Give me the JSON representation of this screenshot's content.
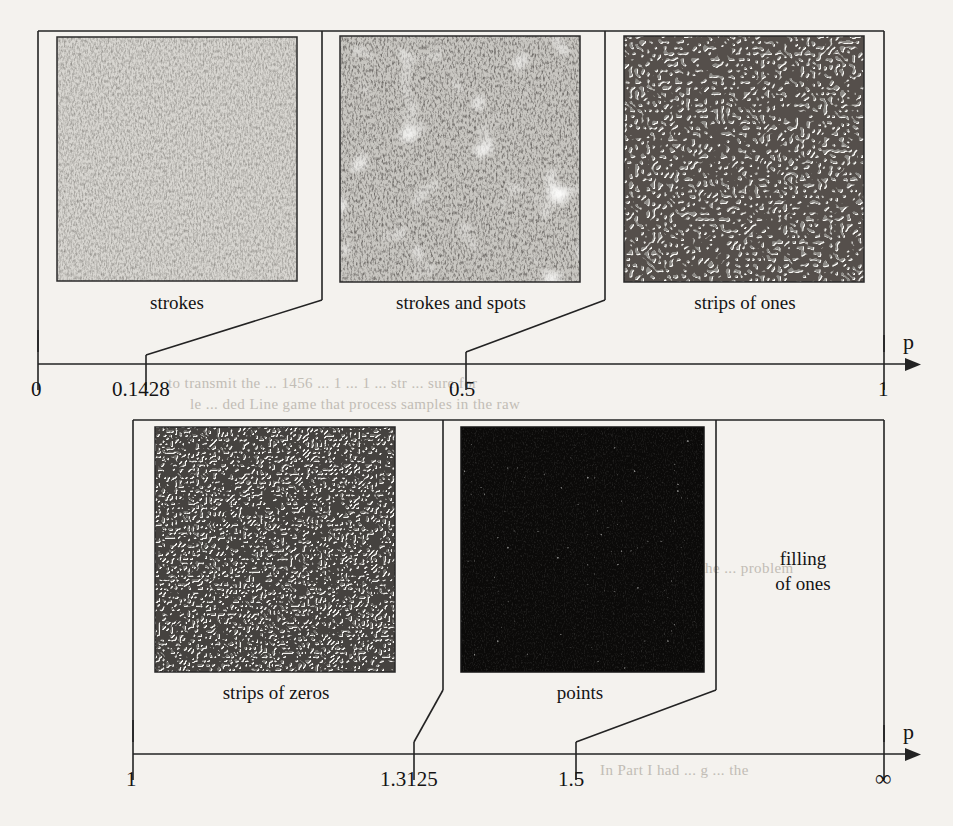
{
  "figure": {
    "kind": "parameter-line-diagram",
    "axis_name": "p",
    "background_color": "#f4f2ee",
    "ink_color": "#1a1a1a"
  },
  "axes": [
    {
      "id": "top-axis",
      "name": "p",
      "start_label": "0",
      "end_label": "1",
      "ticks": [
        {
          "value": "0",
          "pos": 0.0
        },
        {
          "value": "0.1428",
          "pos": 0.1428
        },
        {
          "value": "0.5",
          "pos": 0.5
        },
        {
          "value": "1",
          "pos": 1.0
        }
      ],
      "regions": [
        {
          "label": "strokes",
          "from": "0",
          "to": "0.1428"
        },
        {
          "label": "strokes and spots",
          "from": "0.1428",
          "to": "0.5"
        },
        {
          "label": "strips of ones",
          "from": "0.5",
          "to": "1"
        }
      ]
    },
    {
      "id": "bottom-axis",
      "name": "p",
      "start_label": "1",
      "end_label": "∞",
      "ticks": [
        {
          "value": "1",
          "pos": 0.0
        },
        {
          "value": "1.3125",
          "pos": 0.3125
        },
        {
          "value": "1.5",
          "pos": 0.5
        },
        {
          "value": "∞",
          "pos": 1.0
        }
      ],
      "regions": [
        {
          "label": "strips of zeros",
          "from": "1",
          "to": "1.3125"
        },
        {
          "label": "points",
          "from": "1.3125",
          "to": "1.5"
        },
        {
          "label": "filling of ones",
          "from": "1.5",
          "to": "∞"
        }
      ]
    }
  ],
  "panels": [
    {
      "id": "panel-strokes",
      "caption": "strokes",
      "texture": "fine-light-strokes",
      "base_color": "#cfcdc8",
      "ink_color": "#4a4845",
      "density": 0.34
    },
    {
      "id": "panel-strokes-and-spots",
      "caption": "strokes and spots",
      "texture": "strokes-with-white-spots",
      "base_color": "#b7b5b0",
      "ink_color": "#2e2c2a",
      "density": 0.55
    },
    {
      "id": "panel-strips-of-ones",
      "caption": "strips of ones",
      "texture": "labyrinth-mid-gray",
      "base_color": "#8d8b87",
      "ink_color": "#24221f",
      "density": 0.62
    },
    {
      "id": "panel-strips-of-zeros",
      "caption": "strips of zeros",
      "texture": "labyrinth-dense-dark",
      "base_color": "#6e6c68",
      "ink_color": "#171513",
      "density": 0.74
    },
    {
      "id": "panel-points",
      "caption": "points",
      "texture": "black-with-white-points",
      "base_color": "#0c0b0a",
      "ink_color": "#e8e6e0",
      "density": 0.06
    },
    {
      "id": "panel-filling-of-ones",
      "caption": "filling\nof ones",
      "caption_line1": "filling",
      "caption_line2": "of ones",
      "texture": "none",
      "base_color": "#f4f2ee"
    }
  ],
  "bleed_text": [
    {
      "text": "to transmit  the  ... 1456 ... 1 ... 1 ... str ... sure for",
      "x": 168,
      "y": 383
    },
    {
      "text": "le ... ded  Line game that process samples in the raw",
      "x": 190,
      "y": 404
    },
    {
      "text": "the ... are ... the ... problem",
      "x": 300,
      "y": 575
    },
    {
      "text": "In Part I had ...  g ... the",
      "x": 300,
      "y": 770
    }
  ]
}
